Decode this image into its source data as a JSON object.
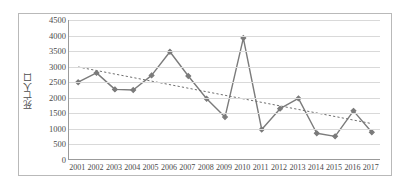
{
  "chart_data": {
    "type": "line",
    "title": "",
    "xlabel": "",
    "ylabel": "死亡人口",
    "ylim": [
      0,
      4500
    ],
    "ytick_step": 500,
    "yticks": [
      "0",
      "500",
      "1000",
      "1500",
      "2000",
      "2500",
      "3000",
      "3500",
      "4000",
      "4500"
    ],
    "grid": true,
    "legend": "none",
    "categories": [
      "2001",
      "2002",
      "2003",
      "2004",
      "2005",
      "2006",
      "2007",
      "2008",
      "2009",
      "2010",
      "2011",
      "2012",
      "2013",
      "2014",
      "2015",
      "2016",
      "2017"
    ],
    "series": [
      {
        "name": "死亡人口",
        "type": "line-with-markers",
        "color": "#7b7b7b",
        "marker": "diamond",
        "values": [
          2500,
          2800,
          2270,
          2250,
          2720,
          3480,
          2700,
          1970,
          1380,
          3920,
          980,
          1650,
          1980,
          860,
          760,
          1580,
          890
        ]
      },
      {
        "name": "trendline",
        "type": "linear-trendline-dotted",
        "color": "#6e6e6e",
        "dash": "dotted",
        "start_value": 2990,
        "end_value": 1170
      }
    ]
  },
  "axes": {
    "y_axis_label": "死亡人口",
    "y_min_label": "0",
    "y_max_label": "4500"
  },
  "colors": {
    "series_line": "#7b7b7b",
    "trendline": "#6e6e6e",
    "gridline": "#d9d9d9",
    "axis": "#9b9b9b",
    "frame": "#b9b9b9",
    "text": "#4a4a4a",
    "background": "#ffffff"
  }
}
